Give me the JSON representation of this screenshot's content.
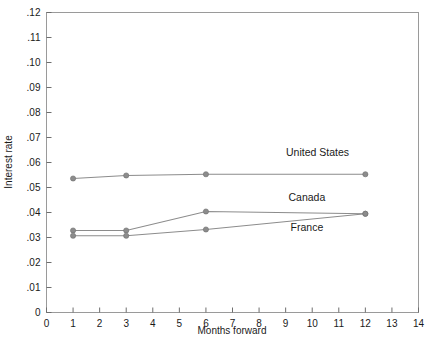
{
  "chart_data": {
    "type": "line",
    "title": "",
    "xlabel": "Months forward",
    "ylabel": "Interest rate",
    "xlim": [
      0,
      14
    ],
    "ylim": [
      0,
      0.12
    ],
    "grid": false,
    "legend_position": "inline-right-of-series",
    "x_ticks": [
      "0",
      "1",
      "2",
      "3",
      "4",
      "5",
      "6",
      "7",
      "8",
      "9",
      "10",
      "11",
      "12",
      "13",
      "14"
    ],
    "x_tick_values": [
      0,
      1,
      2,
      3,
      4,
      5,
      6,
      7,
      8,
      9,
      10,
      11,
      12,
      13,
      14
    ],
    "y_ticks": [
      "0",
      ".01",
      ".02",
      ".03",
      ".04",
      ".05",
      ".06",
      ".07",
      ".08",
      ".09",
      ".10",
      ".11",
      ".12"
    ],
    "y_tick_values": [
      0,
      0.01,
      0.02,
      0.03,
      0.04,
      0.05,
      0.06,
      0.07,
      0.08,
      0.09,
      0.1,
      0.11,
      0.12
    ],
    "x": [
      1,
      3,
      6,
      12
    ],
    "series": [
      {
        "name": "United States",
        "color": "#8c8c8c",
        "x": [
          1,
          3,
          6,
          12
        ],
        "values": [
          0.0536,
          0.0548,
          0.0553,
          0.0553
        ],
        "label_x": 10.2,
        "label_y": 0.0625
      },
      {
        "name": "Canada",
        "color": "#8c8c8c",
        "x": [
          1,
          3,
          6,
          12
        ],
        "values": [
          0.0328,
          0.0328,
          0.0404,
          0.0395
        ],
        "label_x": 9.8,
        "label_y": 0.0446
      },
      {
        "name": "France",
        "color": "#8c8c8c",
        "x": [
          1,
          3,
          6,
          12
        ],
        "values": [
          0.0307,
          0.0307,
          0.0332,
          0.0395
        ],
        "label_x": 9.8,
        "label_y": 0.0328
      }
    ]
  }
}
